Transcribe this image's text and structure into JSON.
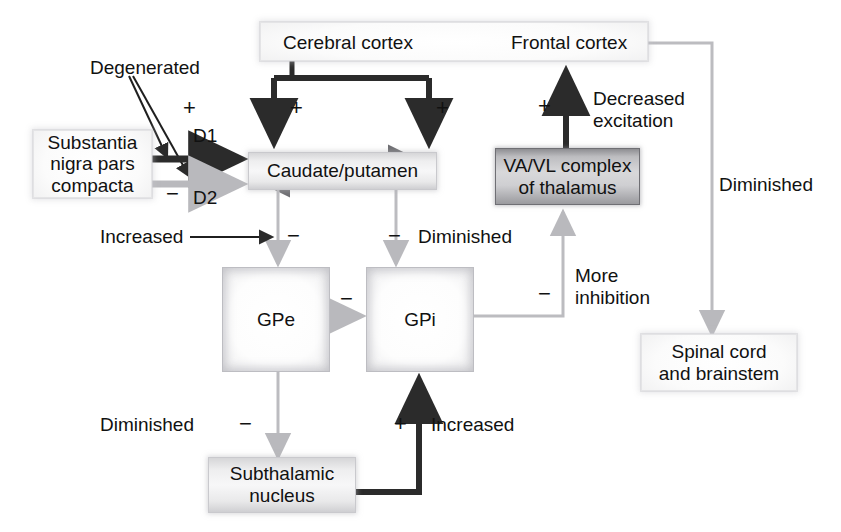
{
  "diagram": {
    "colors": {
      "excitatory_dark": "#2b2b2b",
      "inhibitory_gray": "#b9b9bd",
      "degenerated_dashed": "#8c8c90",
      "text": "#111111",
      "box_light": "#f2f2f3",
      "box_dark": "#b5b5b9"
    }
  },
  "nodes": {
    "cerebral_cortex": "Cerebral cortex",
    "frontal_cortex": "Frontal cortex",
    "substantia_nigra": "Substantia\nnigra pars\ncompacta",
    "substantia_nigra_line1": "Substantia",
    "substantia_nigra_line2": "nigra pars",
    "substantia_nigra_line3": "compacta",
    "caudate_putamen": "Caudate/putamen",
    "va_vl_line1": "VA/VL complex",
    "va_vl_line2": "of thalamus",
    "gpe": "GPe",
    "gpi": "GPi",
    "spinal_line1": "Spinal cord",
    "spinal_line2": "and brainstem",
    "stn_line1": "Subthalamic",
    "stn_line2": "nucleus"
  },
  "labels": {
    "degenerated": "Degenerated",
    "d1": "D1",
    "d2": "D2",
    "increased_left": "Increased",
    "diminished_mid": "Diminished",
    "decreased_excitation_line1": "Decreased",
    "decreased_excitation_line2": "excitation",
    "more_inhibition_line1": "More",
    "more_inhibition_line2": "inhibition",
    "diminished_right": "Diminished",
    "diminished_bottom": "Diminished",
    "increased_bottom": "Increased"
  },
  "signs": {
    "plus_d1": "+",
    "minus_d2": "−",
    "plus_cortex_left": "+",
    "plus_cortex_right": "+",
    "plus_thalamus": "+",
    "minus_caudate_left": "−",
    "minus_caudate_right": "−",
    "minus_gpe_gpi": "−",
    "minus_gpi_thalamus": "−",
    "minus_gpe_stn": "−",
    "plus_stn_gpi": "+"
  },
  "edges": [
    {
      "name": "snc-d1-to-caudate",
      "from": "substantia_nigra",
      "to": "caudate_putamen",
      "style": "thick-dark",
      "sign": "+",
      "pathway": "D1"
    },
    {
      "name": "snc-d2-to-caudate",
      "from": "substantia_nigra",
      "to": "caudate_putamen",
      "style": "thick-gray",
      "sign": "−",
      "pathway": "D2"
    },
    {
      "name": "degenerated-pointer-d1",
      "from": "degenerated-label",
      "to": "snc-d1-arrow",
      "style": "thin-dark"
    },
    {
      "name": "degenerated-pointer-d2",
      "from": "degenerated-label",
      "to": "snc-d2-arrow",
      "style": "thin-dark"
    },
    {
      "name": "cortex-to-caudate-left",
      "from": "cerebral_cortex",
      "to": "caudate_putamen",
      "style": "thick-dark",
      "sign": "+"
    },
    {
      "name": "cortex-to-caudate-right",
      "from": "cerebral_cortex",
      "to": "caudate_putamen",
      "style": "thick-dark",
      "sign": "+"
    },
    {
      "name": "caudate-to-gpe",
      "from": "caudate_putamen",
      "to": "gpe",
      "style": "thin-gray",
      "sign": "−"
    },
    {
      "name": "caudate-to-gpi",
      "from": "caudate_putamen",
      "to": "gpi",
      "style": "thin-gray",
      "sign": "−"
    },
    {
      "name": "increased-pointer",
      "from": "increased-label",
      "to": "caudate-to-gpe",
      "style": "thin-dark"
    },
    {
      "name": "gpe-to-gpi",
      "from": "gpe",
      "to": "gpi",
      "style": "thin-gray",
      "sign": "−"
    },
    {
      "name": "gpe-to-stn",
      "from": "gpe",
      "to": "subthalamic_nucleus",
      "style": "thin-gray",
      "sign": "−"
    },
    {
      "name": "stn-to-gpi",
      "from": "subthalamic_nucleus",
      "to": "gpi",
      "style": "thick-dark",
      "sign": "+"
    },
    {
      "name": "gpi-to-thalamus",
      "from": "gpi",
      "to": "va_vl_thalamus",
      "style": "thin-gray",
      "sign": "−"
    },
    {
      "name": "thalamus-to-frontal-cortex",
      "from": "va_vl_thalamus",
      "to": "frontal_cortex",
      "style": "thick-dark",
      "sign": "+"
    },
    {
      "name": "frontal-cortex-to-spinal",
      "from": "frontal_cortex",
      "to": "spinal_cord",
      "style": "thin-gray"
    }
  ]
}
